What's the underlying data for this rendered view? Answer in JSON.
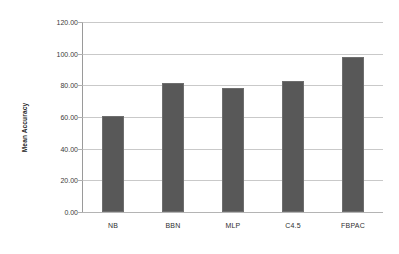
{
  "chart_data": {
    "type": "bar",
    "title": "",
    "subtitle": "",
    "xlabel": "",
    "ylabel": "Mean Accuracy",
    "categories": [
      "NB",
      "BBN",
      "MLP",
      "C4.5",
      "FBPAC"
    ],
    "values": [
      60.5,
      81.3,
      78.5,
      82.6,
      97.8
    ],
    "series": [
      {
        "name": "Mean Accuracy",
        "values": [
          60.5,
          81.3,
          78.5,
          82.6,
          97.8
        ]
      }
    ],
    "ylim": [
      0,
      120
    ],
    "ytick_step": 20,
    "ytick_labels": [
      "0.00",
      "20.00",
      "40.00",
      "60.00",
      "80.00",
      "100.00",
      "120.00"
    ],
    "ytick_values": [
      0,
      20,
      40,
      60,
      80,
      100,
      120
    ],
    "grid": true,
    "grid_axis": "y",
    "legend": false,
    "legend_position": "none",
    "annotations": [],
    "colors": {
      "bar_fill": "#585858",
      "bar_border": "#6e6e6e",
      "gridline": "#c9c9c9",
      "axis_line": "#9a9a9a",
      "background": "#ffffff",
      "text": "#2f2f2f"
    }
  }
}
